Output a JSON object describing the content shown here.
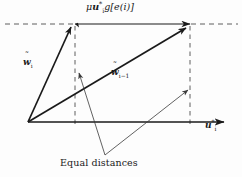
{
  "figure": {
    "name": "adaptive-filter-weight-error-vector-diagram",
    "background_color": "#fdfdfd",
    "line_color": "#1a1a1a",
    "dashed_color": "#555555",
    "thin_line_color": "#3a3a3a"
  },
  "labels": {
    "update_term": {
      "text": "μu*ᵢ g[e(i)]",
      "parts": {
        "mu": "μ",
        "u": "u",
        "u_sup": "*",
        "u_sub": "i",
        "g": "g",
        "bracket_open": "[",
        "e": "e",
        "paren_open": "(",
        "i": "i",
        "paren_close": ")",
        "bracket_close": "]"
      }
    },
    "w_i": {
      "text": "w̃ᵢ",
      "parts": {
        "base": "w",
        "accent": "˜",
        "sub": "i"
      }
    },
    "w_i_minus_1": {
      "text": "w̃ᵢ₋₁",
      "parts": {
        "base": "w",
        "accent": "˜",
        "sub": "i−1"
      }
    },
    "u_axis": {
      "text": "u*ᵢ",
      "parts": {
        "base": "u",
        "sup": "*",
        "sub": "i"
      }
    },
    "equal_distances": {
      "text": "Equal distances"
    }
  },
  "geometry": {
    "origin": {
      "x": 28,
      "y": 122
    },
    "w_i_tip": {
      "x": 73,
      "y": 24
    },
    "w_i_minus_1_tip": {
      "x": 189,
      "y": 25
    },
    "horizontal_axis_y": 122,
    "horizontal_axis_start_x": 28,
    "horizontal_axis_end_x": 226,
    "top_dashed_y": 24,
    "left_dashed_x": 75,
    "right_dashed_x": 190,
    "converge_point": {
      "x": 105,
      "y": 156
    },
    "left_marker": {
      "x": 77,
      "y": 70
    },
    "right_marker": {
      "x": 189,
      "y": 87
    }
  }
}
